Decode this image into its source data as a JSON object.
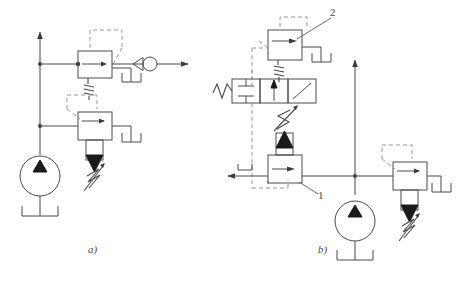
{
  "figure": {
    "type": "hydraulic-circuit-schematic",
    "panels": [
      {
        "id": "a",
        "caption": "a)",
        "components": [
          {
            "name": "pump",
            "symbol": "circle-with-solid-triangle-up",
            "label": ""
          },
          {
            "name": "tank-pump",
            "symbol": "reservoir-open-top",
            "label": ""
          },
          {
            "name": "pressure-relief-valve",
            "symbol": "spring-loaded-cone-valve",
            "label": ""
          },
          {
            "name": "pilot-operated-valve",
            "symbol": "square-box-with-arrow",
            "label": ""
          },
          {
            "name": "check-valve",
            "symbol": "circle-with-cone",
            "label": ""
          },
          {
            "name": "tank-upper",
            "symbol": "reservoir-open-top",
            "label": ""
          },
          {
            "name": "tank-lower",
            "symbol": "reservoir-open-top",
            "label": ""
          },
          {
            "name": "supply-line-arrow",
            "symbol": "arrow-up",
            "label": ""
          },
          {
            "name": "outlet-line-arrow",
            "symbol": "arrow-right",
            "label": ""
          }
        ]
      },
      {
        "id": "b",
        "caption": "b)",
        "components": [
          {
            "name": "pump",
            "symbol": "circle-with-solid-triangle-up",
            "label": ""
          },
          {
            "name": "tank-pump",
            "symbol": "reservoir-open-top",
            "label": ""
          },
          {
            "name": "pressure-relief-valve",
            "symbol": "spring-loaded-cone-valve",
            "label": ""
          },
          {
            "name": "pilot-operated-valve-2",
            "symbol": "square-box-with-arrow",
            "label": "2"
          },
          {
            "name": "sequence-valve-1",
            "symbol": "spring-loaded-cone-valve",
            "label": "1"
          },
          {
            "name": "directional-control-valve",
            "symbol": "three-position-four-way",
            "label": ""
          },
          {
            "name": "solenoid-actuator",
            "symbol": "zigzag-coil",
            "label": ""
          },
          {
            "name": "lever-actuator",
            "symbol": "diagonal-lever",
            "label": ""
          },
          {
            "name": "tank-valve2",
            "symbol": "reservoir-open-top",
            "label": ""
          },
          {
            "name": "tank-relief",
            "symbol": "reservoir-open-top",
            "label": ""
          },
          {
            "name": "supply-line-arrow",
            "symbol": "arrow-up",
            "label": ""
          },
          {
            "name": "outlet-line-arrow",
            "symbol": "arrow-left",
            "label": ""
          }
        ]
      }
    ],
    "callouts": [
      {
        "id": "callout-1",
        "text": "1"
      },
      {
        "id": "callout-2",
        "text": "2"
      }
    ],
    "colors": {
      "line": "#4a4a4a",
      "dashed_pilot_line": "#8a8a8a",
      "fill_solid": "#1a1a1a",
      "background": "#ffffff"
    }
  }
}
